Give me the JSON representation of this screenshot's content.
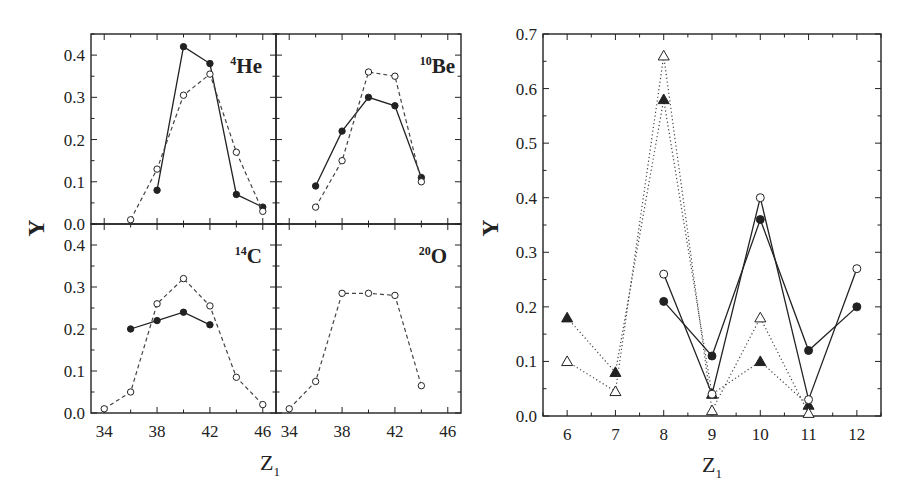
{
  "chart_data": [
    {
      "type": "line",
      "title": "4He",
      "panel_label": {
        "mass": "4",
        "element": "He"
      },
      "xlabel": "Z1",
      "ylabel": "Y",
      "xlim": [
        33,
        47
      ],
      "ylim": [
        0,
        0.45
      ],
      "xticks": [
        34,
        38,
        42,
        46
      ],
      "yticks": [
        0.0,
        0.1,
        0.2,
        0.3,
        0.4
      ],
      "grid": false,
      "series": [
        {
          "name": "filled-circles-solid",
          "marker": "filled-circle",
          "line": "solid",
          "x": [
            38,
            40,
            42,
            44,
            46
          ],
          "y": [
            0.08,
            0.42,
            0.38,
            0.07,
            0.04
          ]
        },
        {
          "name": "open-circles-dashed",
          "marker": "open-circle",
          "line": "dashed",
          "x": [
            36,
            38,
            40,
            42,
            44,
            46
          ],
          "y": [
            0.01,
            0.13,
            0.305,
            0.355,
            0.17,
            0.03
          ]
        }
      ]
    },
    {
      "type": "line",
      "title": "10Be",
      "panel_label": {
        "mass": "10",
        "element": "Be"
      },
      "xlabel": "Z1",
      "ylabel": "Y",
      "xlim": [
        33,
        47
      ],
      "ylim": [
        0,
        0.45
      ],
      "xticks": [
        34,
        38,
        42,
        46
      ],
      "yticks": [
        0.0,
        0.1,
        0.2,
        0.3,
        0.4
      ],
      "grid": false,
      "series": [
        {
          "name": "filled-circles-solid",
          "marker": "filled-circle",
          "line": "solid",
          "x": [
            36,
            38,
            40,
            42,
            44
          ],
          "y": [
            0.09,
            0.22,
            0.3,
            0.28,
            0.11
          ]
        },
        {
          "name": "open-circles-dashed",
          "marker": "open-circle",
          "line": "dashed",
          "x": [
            36,
            38,
            40,
            42,
            44
          ],
          "y": [
            0.04,
            0.15,
            0.36,
            0.35,
            0.1
          ]
        }
      ]
    },
    {
      "type": "line",
      "title": "14C",
      "panel_label": {
        "mass": "14",
        "element": "C"
      },
      "xlabel": "Z1",
      "ylabel": "Y",
      "xlim": [
        33,
        47
      ],
      "ylim": [
        0,
        0.45
      ],
      "xticks": [
        34,
        38,
        42,
        46
      ],
      "yticks": [
        0.0,
        0.1,
        0.2,
        0.3,
        0.4
      ],
      "grid": false,
      "series": [
        {
          "name": "filled-circles-solid",
          "marker": "filled-circle",
          "line": "solid",
          "x": [
            36,
            38,
            40,
            42
          ],
          "y": [
            0.2,
            0.22,
            0.24,
            0.21
          ]
        },
        {
          "name": "open-circles-dashed",
          "marker": "open-circle",
          "line": "dashed",
          "x": [
            34,
            36,
            38,
            40,
            42,
            44,
            46
          ],
          "y": [
            0.01,
            0.05,
            0.26,
            0.32,
            0.255,
            0.085,
            0.02
          ]
        }
      ]
    },
    {
      "type": "line",
      "title": "20O",
      "panel_label": {
        "mass": "20",
        "element": "O"
      },
      "xlabel": "Z1",
      "ylabel": "Y",
      "xlim": [
        33,
        47
      ],
      "ylim": [
        0,
        0.45
      ],
      "xticks": [
        34,
        38,
        42,
        46
      ],
      "yticks": [
        0.0,
        0.1,
        0.2,
        0.3,
        0.4
      ],
      "grid": false,
      "series": [
        {
          "name": "open-circles-dashed",
          "marker": "open-circle",
          "line": "dashed",
          "x": [
            34,
            36,
            38,
            40,
            42,
            44
          ],
          "y": [
            0.01,
            0.075,
            0.285,
            0.285,
            0.28,
            0.065
          ]
        }
      ]
    },
    {
      "type": "line",
      "title": "",
      "xlabel": "Z1",
      "ylabel": "Y",
      "xlim": [
        5.5,
        12.5
      ],
      "ylim": [
        0,
        0.7
      ],
      "xticks": [
        6,
        7,
        8,
        9,
        10,
        11,
        12
      ],
      "yticks": [
        0.0,
        0.1,
        0.2,
        0.3,
        0.4,
        0.5,
        0.6,
        0.7
      ],
      "grid": false,
      "series": [
        {
          "name": "filled-triangles-dotted",
          "marker": "filled-triangle",
          "line": "dotted",
          "x": [
            6,
            7,
            8,
            9,
            10,
            11
          ],
          "y": [
            0.18,
            0.08,
            0.58,
            0.04,
            0.1,
            0.02
          ]
        },
        {
          "name": "open-triangles-dotted",
          "marker": "open-triangle",
          "line": "dotted",
          "x": [
            6,
            7,
            8,
            9,
            10,
            11
          ],
          "y": [
            0.1,
            0.045,
            0.66,
            0.01,
            0.18,
            0.005
          ]
        },
        {
          "name": "filled-circles-solid",
          "marker": "filled-circle",
          "line": "solid",
          "x": [
            8,
            9,
            10,
            11,
            12
          ],
          "y": [
            0.21,
            0.11,
            0.36,
            0.12,
            0.2
          ]
        },
        {
          "name": "open-circles-solid",
          "marker": "open-circle",
          "line": "solid",
          "x": [
            8,
            9,
            10,
            11,
            12
          ],
          "y": [
            0.26,
            0.04,
            0.4,
            0.03,
            0.27
          ]
        }
      ]
    }
  ],
  "labels": {
    "left_ylabel": "Y",
    "left_xlabel_main": "Z",
    "left_xlabel_sub": "1",
    "right_ylabel": "Y",
    "right_xlabel_main": "Z",
    "right_xlabel_sub": "1"
  },
  "colors": {
    "ink": "#222222",
    "background": "#ffffff"
  }
}
